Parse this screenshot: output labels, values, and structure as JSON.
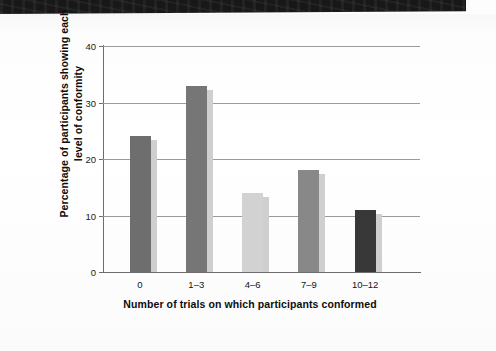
{
  "chart_data": {
    "type": "bar",
    "title": "",
    "categories": [
      "0",
      "1–3",
      "4–6",
      "7–9",
      "10–12"
    ],
    "values": [
      24,
      33,
      14,
      18,
      11
    ],
    "series": [
      {
        "name": "Percentage of participants",
        "values": [
          24,
          33,
          14,
          18,
          11
        ]
      }
    ],
    "bar_colors": [
      "#6e6e6e",
      "#767676",
      "#d2d2d2",
      "#888888",
      "#383838"
    ],
    "xlabel": "Number of trials on which participants conformed",
    "ylabel": "Percentage of participants showing each level of conformity",
    "ylim": [
      0,
      40
    ],
    "yticks": [
      0,
      10,
      20,
      30,
      40
    ],
    "ytick_labels": [
      "0",
      "10",
      "20",
      "30",
      "40"
    ],
    "grid": "horizontal",
    "legend": "none"
  },
  "figure": {
    "background_color": "#ffffff",
    "axis_color": "#6d6d6d",
    "gridline_color": "#9b9b9b",
    "scan_band_color": "#191818"
  }
}
